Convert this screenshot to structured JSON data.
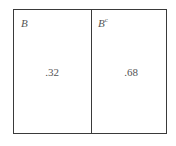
{
  "diagram": {
    "type": "venn-partition",
    "regions": [
      {
        "label": "B",
        "superscript": "",
        "probability": ".32"
      },
      {
        "label": "B",
        "superscript": "c",
        "probability": ".68"
      }
    ]
  }
}
